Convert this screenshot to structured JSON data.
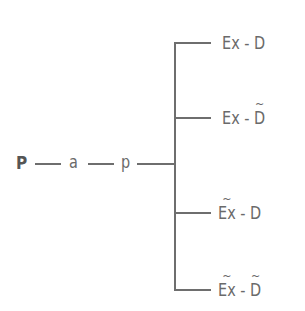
{
  "diagram": {
    "type": "tree",
    "root": {
      "label": "P",
      "bold": true
    },
    "chain": [
      {
        "label": "a"
      },
      {
        "label": "p"
      }
    ],
    "branches": [
      {
        "left": {
          "base": "Ex",
          "tilde": false
        },
        "separator": "-",
        "right": {
          "base": "D",
          "tilde": false
        }
      },
      {
        "left": {
          "base": "Ex",
          "tilde": false
        },
        "separator": "-",
        "right": {
          "base": "D",
          "tilde": true
        }
      },
      {
        "left": {
          "base": "Ex",
          "tilde": true
        },
        "separator": "-",
        "right": {
          "base": "D",
          "tilde": false
        }
      },
      {
        "left": {
          "base": "Ex",
          "tilde": true
        },
        "separator": "-",
        "right": {
          "base": "D",
          "tilde": true
        }
      }
    ],
    "tilde_glyph": "~",
    "line_color": "#6e6e6e",
    "text_color": "#6a6a6a"
  }
}
